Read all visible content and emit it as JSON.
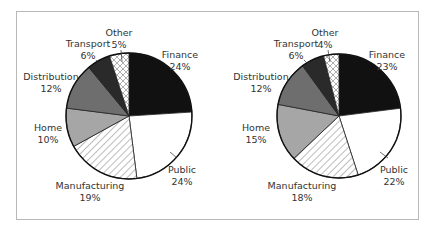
{
  "chart_data": [
    {
      "type": "pie",
      "title": "",
      "categories": [
        "Finance",
        "Public",
        "Manufacturing",
        "Home",
        "Distribution",
        "Transport",
        "Other"
      ],
      "values": [
        24,
        24,
        19,
        10,
        12,
        6,
        5
      ],
      "labels": [
        "24%",
        "24%",
        "19%",
        "10%",
        "12%",
        "6%",
        "5%"
      ],
      "fills": [
        "#111111",
        "#ffffff",
        "hatch-diagonal",
        "#a6a6a6",
        "#6e6e6e",
        "#2a2a2a",
        "crosshatch"
      ]
    },
    {
      "type": "pie",
      "title": "",
      "categories": [
        "Finance",
        "Public",
        "Manufacturing",
        "Home",
        "Distribution",
        "Transport",
        "Other"
      ],
      "values": [
        23,
        22,
        18,
        15,
        12,
        6,
        4
      ],
      "labels": [
        "23%",
        "22%",
        "18%",
        "15%",
        "12%",
        "6%",
        "4%"
      ],
      "fills": [
        "#111111",
        "#ffffff",
        "hatch-diagonal",
        "#a6a6a6",
        "#6e6e6e",
        "#2a2a2a",
        "crosshatch"
      ]
    }
  ],
  "left": {
    "finance": {
      "name": "Finance",
      "pct": "24%"
    },
    "public": {
      "name": "Public",
      "pct": "24%"
    },
    "manufacturing": {
      "name": "Manufacturing",
      "pct": "19%"
    },
    "home": {
      "name": "Home",
      "pct": "10%"
    },
    "distribution": {
      "name": "Distribution",
      "pct": "12%"
    },
    "transport": {
      "name": "Transport",
      "pct": "6%"
    },
    "other": {
      "name": "Other",
      "pct": "5%"
    }
  },
  "right": {
    "finance": {
      "name": "Finance",
      "pct": "23%"
    },
    "public": {
      "name": "Public",
      "pct": "22%"
    },
    "manufacturing": {
      "name": "Manufacturing",
      "pct": "18%"
    },
    "home": {
      "name": "Home",
      "pct": "15%"
    },
    "distribution": {
      "name": "Distribution",
      "pct": "12%"
    },
    "transport": {
      "name": "Transport",
      "pct": "6%"
    },
    "other": {
      "name": "Other",
      "pct": "4%"
    }
  }
}
